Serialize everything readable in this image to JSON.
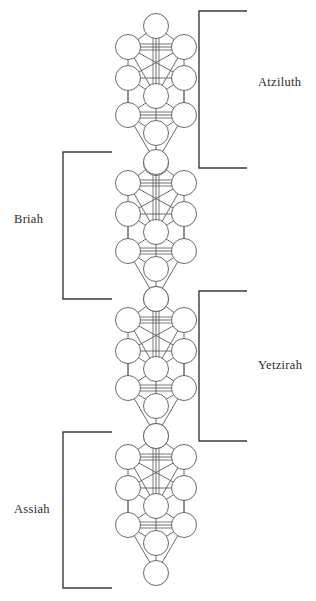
{
  "figure": {
    "background_color": "#ffffff",
    "line_color": "#58595b",
    "node_fill": "#ffffff",
    "bracket_color": "#3b3b3b",
    "text_color": "#2b2b2b"
  },
  "worlds": [
    {
      "label": "Atziluth",
      "side": "right",
      "bracket": {
        "x_outer": 247,
        "x_inner": 199,
        "y_top": 11,
        "y_bottom": 168
      },
      "label_x": 258,
      "label_y": 83
    },
    {
      "label": "Briah",
      "side": "left",
      "bracket": {
        "x_outer": 63,
        "x_inner": 112,
        "y_top": 152,
        "y_bottom": 299
      },
      "label_x": 14,
      "label_y": 220
    },
    {
      "label": "Yetzirah",
      "side": "right",
      "bracket": {
        "x_outer": 247,
        "x_inner": 199,
        "y_top": 291,
        "y_bottom": 441
      },
      "label_x": 258,
      "label_y": 366
    },
    {
      "label": "Assiah",
      "side": "left",
      "bracket": {
        "x_outer": 63,
        "x_inner": 112,
        "y_top": 432,
        "y_bottom": 588
      },
      "label_x": 14,
      "label_y": 510
    }
  ],
  "tree_geometry": {
    "node_radius": 12.5,
    "center_x": 156,
    "side_offset": 28,
    "tree_tops": [
      14,
      150,
      287,
      424
    ],
    "sephiroth_offsets": [
      {
        "name": "kether",
        "dx": 0,
        "dy": 12
      },
      {
        "name": "chokmah",
        "dx": 28,
        "dy": 33
      },
      {
        "name": "binah",
        "dx": -28,
        "dy": 33
      },
      {
        "name": "chesed",
        "dx": 28,
        "dy": 64
      },
      {
        "name": "geburah",
        "dx": -28,
        "dy": 64
      },
      {
        "name": "tiphareth",
        "dx": 0,
        "dy": 82
      },
      {
        "name": "netzach",
        "dx": 28,
        "dy": 101
      },
      {
        "name": "hod",
        "dx": -28,
        "dy": 101
      },
      {
        "name": "yesod",
        "dx": 0,
        "dy": 119
      },
      {
        "name": "daath",
        "dx": 0,
        "dy": 47
      },
      {
        "name": "malkuth",
        "dx": 0,
        "dy": 149
      }
    ],
    "paths": [
      [
        "kether",
        "chokmah"
      ],
      [
        "kether",
        "binah"
      ],
      [
        "kether",
        "tiphareth"
      ],
      [
        "chokmah",
        "binah"
      ],
      [
        "chokmah",
        "chesed"
      ],
      [
        "chokmah",
        "tiphareth"
      ],
      [
        "chokmah",
        "geburah"
      ],
      [
        "binah",
        "geburah"
      ],
      [
        "binah",
        "tiphareth"
      ],
      [
        "binah",
        "chesed"
      ],
      [
        "chesed",
        "geburah"
      ],
      [
        "chesed",
        "tiphareth"
      ],
      [
        "chesed",
        "netzach"
      ],
      [
        "geburah",
        "tiphareth"
      ],
      [
        "geburah",
        "hod"
      ],
      [
        "tiphareth",
        "netzach"
      ],
      [
        "tiphareth",
        "hod"
      ],
      [
        "tiphareth",
        "yesod"
      ],
      [
        "netzach",
        "hod"
      ],
      [
        "netzach",
        "yesod"
      ],
      [
        "netzach",
        "malkuth"
      ],
      [
        "hod",
        "yesod"
      ],
      [
        "hod",
        "malkuth"
      ],
      [
        "yesod",
        "malkuth"
      ]
    ]
  }
}
